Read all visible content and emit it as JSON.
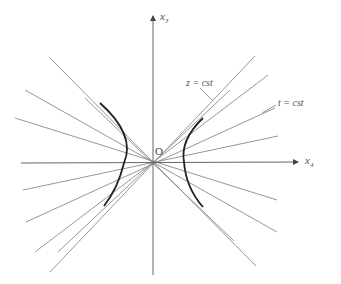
{
  "diagram": {
    "type": "spacetime hyperbola diagram",
    "origin": {
      "label": "O",
      "x": 153,
      "y": 162
    },
    "axes": {
      "vertical": {
        "label": "x",
        "subscript": "3",
        "from": [
          153,
          275
        ],
        "to": [
          153,
          16
        ]
      },
      "horizontal": {
        "label": "x",
        "subscript": "4",
        "from": [
          21,
          163
        ],
        "to": [
          298,
          162
        ]
      }
    },
    "annotations": [
      {
        "id": "z-const",
        "text": "z = cst",
        "x": 198,
        "y": 84,
        "leader_to": [
          213,
          101
        ]
      },
      {
        "id": "t-const",
        "text": "t = cst",
        "x": 278,
        "y": 106,
        "leader_to": [
          260,
          114
        ]
      }
    ],
    "colors": {
      "line": "#888888",
      "axis": "#666666",
      "hyperbola": "#222222"
    }
  }
}
